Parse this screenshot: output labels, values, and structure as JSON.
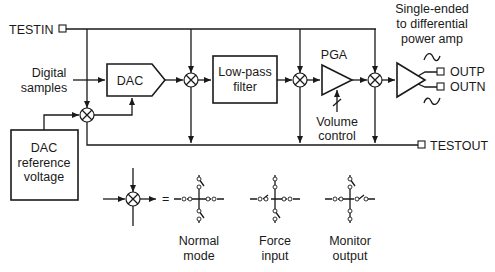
{
  "diagram": {
    "colors": {
      "stroke": "#1a1a1a",
      "background": "#ffffff"
    },
    "pins": {
      "testin": "TESTIN",
      "testout": "TESTOUT",
      "outp": "OUTP",
      "outn": "OUTN"
    },
    "inputs": {
      "digital_samples": [
        "Digital",
        "samples"
      ]
    },
    "blocks": {
      "dac": "DAC",
      "lowpass": [
        "Low-pass",
        "filter"
      ],
      "pga": "PGA",
      "dac_ref": [
        "DAC",
        "reference",
        "voltage"
      ],
      "power_amp": [
        "Single-ended",
        "to differential",
        "power amp"
      ]
    },
    "controls": {
      "volume": [
        "Volume",
        "control"
      ]
    },
    "legend": {
      "equals": "=",
      "modes": [
        {
          "label": [
            "Normal",
            "mode"
          ]
        },
        {
          "label": [
            "Force",
            "input"
          ]
        },
        {
          "label": [
            "Monitor",
            "output"
          ]
        }
      ]
    },
    "icons": {
      "mixer": "test-mux-icon",
      "sine_positive": "sine-wave-icon",
      "sine_negative": "inverted-sine-wave-icon"
    }
  }
}
